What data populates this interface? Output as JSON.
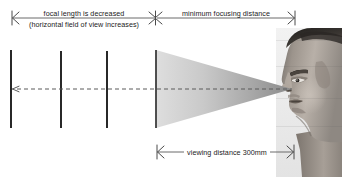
{
  "figure": {
    "background_color": "#ffffff",
    "line_color": "#4a4a4a",
    "bar_color": "#111111",
    "cone_color_light": "#d8d8d8",
    "cone_color_dark": "#8f8f8f",
    "text_color": "#1a1a1a"
  },
  "annotations": {
    "top_left_primary": "focal length is decreased",
    "top_left_secondary": "(horizontal field of view increases)",
    "top_right": "minimum focusing distance",
    "bottom": "viewing distance 300mm"
  },
  "dimension_lines": [
    {
      "name": "focal-length-dimension",
      "label": "focal length is decreased",
      "sublabel": "(horizontal field of view increases)",
      "x_start": 12,
      "x_end": 155,
      "y": 18,
      "start_cap": "double-wing-arrow",
      "end_cap": "x-arrow"
    },
    {
      "name": "minimum-focusing-distance-dimension",
      "label": "minimum focusing distance",
      "x_start": 155,
      "x_end": 295,
      "y": 18,
      "start_cap": "x-arrow",
      "end_cap": "double-wing-arrow"
    },
    {
      "name": "viewing-distance-dimension",
      "label": "viewing distance 300mm",
      "x_start": 157,
      "x_end": 294,
      "y": 152,
      "start_cap": "double-wing-arrow",
      "end_cap": "double-wing-arrow"
    }
  ],
  "optical_axis": {
    "name": "optical-axis",
    "style": "dashed",
    "x_start": 13,
    "x_end": 292,
    "y": 89,
    "arrow_direction": "left"
  },
  "field_planes": [
    {
      "name": "field-plane-1",
      "x": 11,
      "y_top": 50,
      "y_bottom": 128
    },
    {
      "name": "field-plane-2",
      "x": 61,
      "y_top": 51,
      "y_bottom": 128
    },
    {
      "name": "field-plane-3",
      "x": 107,
      "y_top": 51,
      "y_bottom": 128
    },
    {
      "name": "field-plane-4",
      "x": 156,
      "y_top": 50,
      "y_bottom": 128
    }
  ],
  "view_cone": {
    "name": "view-cone",
    "base_x": 156,
    "base_y_top": 50,
    "base_y_bottom": 128,
    "apex_x": 292,
    "apex_y": 89
  },
  "subject": {
    "name": "observer-head-photo",
    "description": "grayscale photograph of a man's head in left-facing profile",
    "x": 276,
    "y": 28,
    "width": 66,
    "height": 149
  }
}
